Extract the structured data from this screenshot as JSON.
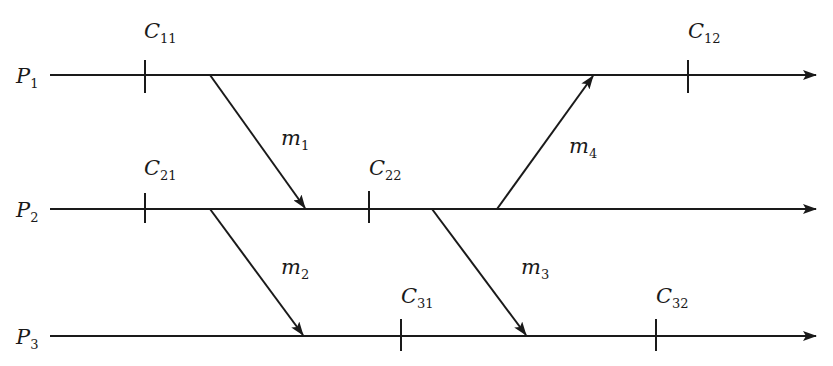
{
  "diagram": {
    "type": "space-time message diagram",
    "processes": [
      {
        "id": "P1",
        "label": "P",
        "sub": "1",
        "y": 75
      },
      {
        "id": "P2",
        "label": "P",
        "sub": "2",
        "y": 209
      },
      {
        "id": "P3",
        "label": "P",
        "sub": "3",
        "y": 336
      }
    ],
    "checkpoints": [
      {
        "id": "C11",
        "label": "C",
        "sub": "11",
        "process": "P1",
        "x": 145
      },
      {
        "id": "C12",
        "label": "C",
        "sub": "12",
        "process": "P1",
        "x": 688
      },
      {
        "id": "C21",
        "label": "C",
        "sub": "21",
        "process": "P2",
        "x": 145
      },
      {
        "id": "C22",
        "label": "C",
        "sub": "22",
        "process": "P2",
        "x": 369
      },
      {
        "id": "C31",
        "label": "C",
        "sub": "31",
        "process": "P3",
        "x": 401
      },
      {
        "id": "C32",
        "label": "C",
        "sub": "32",
        "process": "P3",
        "x": 656
      }
    ],
    "messages": [
      {
        "id": "m1",
        "label": "m",
        "sub": "1",
        "from": "P1",
        "to": "P2"
      },
      {
        "id": "m2",
        "label": "m",
        "sub": "2",
        "from": "P2",
        "to": "P3"
      },
      {
        "id": "m3",
        "label": "m",
        "sub": "3",
        "from": "P2",
        "to": "P3"
      },
      {
        "id": "m4",
        "label": "m",
        "sub": "4",
        "from": "P2",
        "to": "P1"
      }
    ],
    "colors": {
      "line": "#1a1a1a",
      "background": "#ffffff"
    }
  }
}
